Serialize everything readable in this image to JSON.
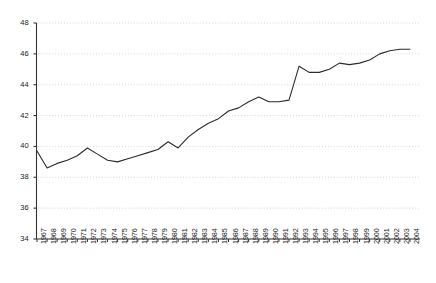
{
  "chart_data": {
    "type": "line",
    "title": "",
    "subtitle": "",
    "xlabel": "",
    "ylabel": "",
    "xlim": [
      1967,
      2004
    ],
    "ylim": [
      34,
      48
    ],
    "grid": "horizontal-dotted",
    "legend": "none",
    "line_color": "#2b2b2b",
    "gridline_color": "#bfbfbf",
    "axis_color": "#333333",
    "ytick_values": [
      34,
      36,
      38,
      40,
      42,
      44,
      46,
      48
    ],
    "ytick_labels": [
      "34",
      "36",
      "38",
      "40",
      "42",
      "44",
      "46",
      "48"
    ],
    "categories": [
      "1967",
      "1968",
      "1969",
      "1970",
      "1971",
      "1972",
      "1973",
      "1974",
      "1975",
      "1976",
      "1977",
      "1978",
      "1979",
      "1980",
      "1981",
      "1982",
      "1983",
      "1984",
      "1985",
      "1986",
      "1987",
      "1988",
      "1989",
      "1990",
      "1991",
      "1992",
      "1993",
      "1994",
      "1995",
      "1996",
      "1997",
      "1998",
      "1999",
      "2000",
      "2001",
      "2002",
      "2003",
      "2004"
    ],
    "values": [
      39.7,
      38.6,
      38.9,
      39.1,
      39.4,
      39.9,
      39.5,
      39.1,
      39.0,
      39.2,
      39.4,
      39.6,
      39.8,
      40.3,
      39.9,
      40.6,
      41.1,
      41.5,
      41.8,
      42.3,
      42.5,
      42.9,
      43.2,
      42.9,
      42.9,
      43.0,
      45.2,
      44.8,
      44.8,
      45.0,
      45.4,
      45.3,
      45.4,
      45.6,
      46.0,
      46.2,
      46.3,
      46.3
    ]
  }
}
